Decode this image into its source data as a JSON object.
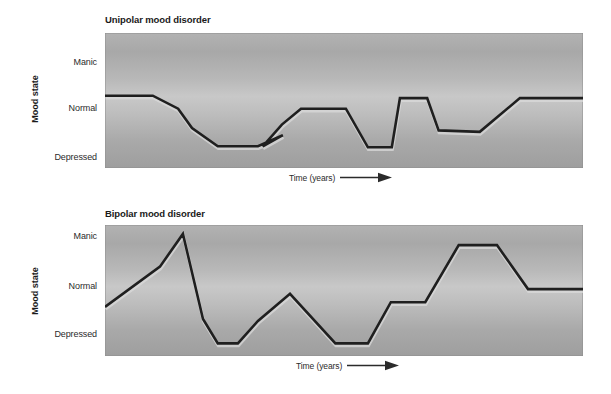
{
  "figure": {
    "background": "#ffffff",
    "plot_fill_top": "#b2b2b2",
    "plot_fill_mid": "#c8c8c8",
    "plot_fill_bottom": "#9e9e9e",
    "line_color": "#1f1f1f",
    "text_color": "#1a1a1a"
  },
  "panels": [
    {
      "id": "unipolar",
      "title": "Unipolar mood disorder",
      "y_axis_label": "Mood state",
      "y_ticks": [
        "Manic",
        "Normal",
        "Depressed"
      ],
      "x_axis_label": "Time (years)",
      "x_axis_arrow": "right-arrow-icon"
    },
    {
      "id": "bipolar",
      "title": "Bipolar mood disorder",
      "y_axis_label": "Mood state",
      "y_ticks": [
        "Manic",
        "Normal",
        "Depressed"
      ],
      "x_axis_label": "Time (years)",
      "x_axis_arrow": "right-arrow-icon"
    }
  ],
  "chart_data": [
    {
      "type": "line",
      "id": "unipolar",
      "title": "Unipolar mood disorder",
      "xlabel": "Time (years)",
      "ylabel": "Mood state",
      "y_categories": [
        "Manic",
        "Normal",
        "Depressed"
      ],
      "y_category_values": [
        1.0,
        0.0,
        -1.0
      ],
      "ylim": [
        -1.45,
        1.35
      ],
      "xlim": [
        0,
        100
      ],
      "grid": false,
      "legend": "none",
      "description": "Mood oscillates between normal and depressed only; never rises above normal.",
      "series": [
        {
          "name": "mood",
          "points": [
            {
              "x": 0.0,
              "y": 0.05
            },
            {
              "x": 10.0,
              "y": 0.05
            },
            {
              "x": 15.3,
              "y": -0.22
            },
            {
              "x": 18.2,
              "y": -0.62
            },
            {
              "x": 23.6,
              "y": -1.0
            },
            {
              "x": 32.0,
              "y": -1.0
            },
            {
              "x": 37.2,
              "y": -0.77
            },
            {
              "x": 37.2,
              "y": -0.77
            },
            {
              "x": 33.0,
              "y": -1.0
            },
            {
              "x": 37.0,
              "y": -0.55
            },
            {
              "x": 41.0,
              "y": -0.22
            },
            {
              "x": 50.4,
              "y": -0.22
            },
            {
              "x": 55.0,
              "y": -1.02
            },
            {
              "x": 60.0,
              "y": -1.02
            },
            {
              "x": 61.7,
              "y": 0.0
            },
            {
              "x": 67.4,
              "y": 0.0
            },
            {
              "x": 69.8,
              "y": -0.67
            },
            {
              "x": 78.4,
              "y": -0.7
            },
            {
              "x": 86.8,
              "y": 0.0
            },
            {
              "x": 100.0,
              "y": 0.0
            }
          ]
        }
      ]
    },
    {
      "type": "line",
      "id": "bipolar",
      "title": "Bipolar mood disorder",
      "xlabel": "Time (years)",
      "ylabel": "Mood state",
      "y_categories": [
        "Manic",
        "Normal",
        "Depressed"
      ],
      "y_category_values": [
        1.0,
        0.0,
        -1.0
      ],
      "ylim": [
        -1.45,
        1.35
      ],
      "xlim": [
        0,
        100
      ],
      "grid": false,
      "legend": "none",
      "description": "Mood swings both above normal into mania and below normal into depression.",
      "series": [
        {
          "name": "mood",
          "points": [
            {
              "x": 0.0,
              "y": -0.4
            },
            {
              "x": 11.5,
              "y": 0.46
            },
            {
              "x": 16.3,
              "y": 1.16
            },
            {
              "x": 20.5,
              "y": -0.66
            },
            {
              "x": 23.6,
              "y": -1.18
            },
            {
              "x": 27.8,
              "y": -1.18
            },
            {
              "x": 32.0,
              "y": -0.7
            },
            {
              "x": 38.7,
              "y": -0.12
            },
            {
              "x": 48.2,
              "y": -1.18
            },
            {
              "x": 55.0,
              "y": -1.18
            },
            {
              "x": 59.8,
              "y": -0.3
            },
            {
              "x": 67.0,
              "y": -0.3
            },
            {
              "x": 74.0,
              "y": 0.92
            },
            {
              "x": 82.0,
              "y": 0.92
            },
            {
              "x": 88.5,
              "y": -0.02
            },
            {
              "x": 100.0,
              "y": -0.02
            }
          ]
        }
      ]
    }
  ]
}
